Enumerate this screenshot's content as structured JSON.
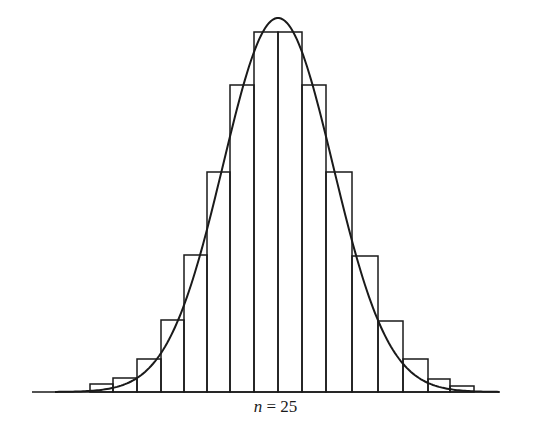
{
  "chart_data": {
    "type": "bar",
    "title": "",
    "subtitle": "",
    "caption": {
      "variable": "n",
      "equals": "=",
      "value": "25"
    },
    "xlabel": "",
    "ylabel": "",
    "grid": false,
    "legend": null,
    "categories": [
      2,
      3,
      4,
      5,
      6,
      7,
      8,
      9,
      10,
      11,
      12,
      13,
      14,
      15,
      16,
      17,
      18,
      19,
      20,
      21,
      22,
      23,
      24
    ],
    "bin_edges_px": [
      62,
      90,
      113,
      137,
      161,
      184,
      207,
      230,
      254,
      278,
      302,
      326,
      352,
      378,
      403,
      428,
      450,
      474,
      500
    ],
    "bar_tops_px": [
      392,
      384,
      378,
      359,
      320,
      255,
      172,
      85,
      32,
      32,
      85,
      172,
      256,
      321,
      359,
      379,
      386,
      392
    ],
    "relative_heights": [
      0.0,
      0.02,
      0.04,
      0.09,
      0.2,
      0.38,
      0.61,
      0.85,
      1.0,
      1.0,
      0.85,
      0.61,
      0.38,
      0.2,
      0.09,
      0.04,
      0.02,
      0.0
    ],
    "overlay": {
      "type": "normal_curve",
      "mean_px": 278,
      "peak_px": 18,
      "sigma_px": 55
    },
    "baseline_px": 392
  },
  "colors": {
    "ink": "#1a1a1a",
    "background": "#ffffff"
  }
}
